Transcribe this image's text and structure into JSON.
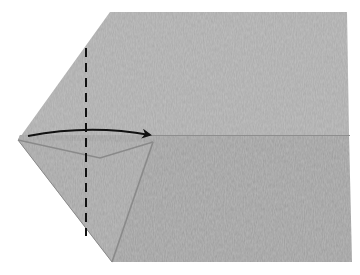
{
  "diagram": {
    "type": "origami-fold-step",
    "colors": {
      "background": "#ffffff",
      "paper_top": "#a9a9a9",
      "paper_bottom": "#9c9c9c",
      "paper_flap": "#a3a3a3",
      "flap_shadow": "#8a8a8a",
      "crease": "#8e8e8e",
      "fold_line": "#111111",
      "arrow": "#111111"
    },
    "elements": {
      "paper": "paper-body",
      "flap": "left-flap",
      "fold_line": "valley-fold-dashed-line",
      "arrow": "fold-direction-arrow",
      "crease": "center-crease"
    }
  }
}
